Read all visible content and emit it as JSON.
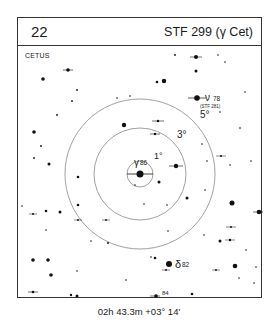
{
  "header": {
    "number": "22",
    "title": "STF 299 (γ Cet)"
  },
  "constellation": "CETUS",
  "coordinates": "02h 43.3m  +03° 14'",
  "circles": [
    {
      "label": "1°",
      "radius": 13
    },
    {
      "label": "3°",
      "radius": 46
    },
    {
      "label": "5°",
      "radius": 75
    }
  ],
  "labels": {
    "gamma": "γ",
    "gamma_mag": "86",
    "nu": "ν",
    "nu_mag": "78",
    "nu_designation": "(STF 281)",
    "delta": "δ",
    "delta_mag": "82",
    "mag84": "84"
  },
  "colors": {
    "ink": "#111111",
    "circle": "#888888",
    "border": "#333333"
  }
}
